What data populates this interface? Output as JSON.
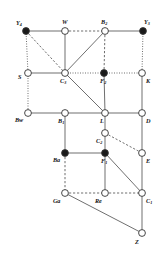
{
  "figure": {
    "type": "lattice-diagram",
    "width": 160,
    "height": 259,
    "background": "#ffffff",
    "edge_color": "#555555",
    "node_stroke": "#333333",
    "node_fill_open": "#ffffff",
    "node_fill_closed": "#1a1a1a"
  },
  "nodes": [
    {
      "id": "Y4",
      "label": "Y",
      "sub": "4",
      "x": 26,
      "y": 31,
      "filled": true,
      "label_dx": -10,
      "label_dy": -11
    },
    {
      "id": "W",
      "label": "W",
      "sub": "",
      "x": 65,
      "y": 31,
      "filled": false,
      "label_dx": -3,
      "label_dy": -12
    },
    {
      "id": "B2",
      "label": "B",
      "sub": "2",
      "x": 105,
      "y": 31,
      "filled": false,
      "label_dx": -4,
      "label_dy": -12
    },
    {
      "id": "Y3",
      "label": "Y",
      "sub": "3",
      "x": 143,
      "y": 31,
      "filled": true,
      "label_dx": 1,
      "label_dy": -12
    },
    {
      "id": "S",
      "label": "S",
      "sub": "",
      "x": 28,
      "y": 73,
      "filled": false,
      "label_dx": -10,
      "label_dy": 1
    },
    {
      "id": "C3",
      "label": "C",
      "sub": "3",
      "x": 65,
      "y": 73,
      "filled": false,
      "label_dx": -5,
      "label_dy": 5
    },
    {
      "id": "F2",
      "label": "F",
      "sub": "2",
      "x": 104,
      "y": 73,
      "filled": true,
      "label_dx": -4,
      "label_dy": 5
    },
    {
      "id": "K",
      "label": "K",
      "sub": "",
      "x": 142,
      "y": 73,
      "filled": false,
      "label_dx": 4,
      "label_dy": 5
    },
    {
      "id": "Bw",
      "label": "Bw",
      "sub": "",
      "x": 28,
      "y": 113,
      "filled": false,
      "label_dx": -13,
      "label_dy": 4
    },
    {
      "id": "B1",
      "label": "B",
      "sub": "1",
      "x": 65,
      "y": 113,
      "filled": false,
      "label_dx": -7,
      "label_dy": 5
    },
    {
      "id": "L",
      "label": "L",
      "sub": "",
      "x": 105,
      "y": 113,
      "filled": false,
      "label_dx": -5,
      "label_dy": 5
    },
    {
      "id": "D",
      "label": "D",
      "sub": "",
      "x": 142,
      "y": 113,
      "filled": false,
      "label_dx": 4,
      "label_dy": 5
    },
    {
      "id": "C2",
      "label": "C",
      "sub": "2",
      "x": 105,
      "y": 133,
      "filled": false,
      "label_dx": -9,
      "label_dy": 5
    },
    {
      "id": "Ba",
      "label": "Ba",
      "sub": "",
      "x": 65,
      "y": 153,
      "filled": true,
      "label_dx": -12,
      "label_dy": 4
    },
    {
      "id": "F1",
      "label": "F",
      "sub": "1",
      "x": 105,
      "y": 153,
      "filled": true,
      "label_dx": -4,
      "label_dy": 5
    },
    {
      "id": "E",
      "label": "E",
      "sub": "",
      "x": 142,
      "y": 153,
      "filled": false,
      "label_dx": 4,
      "label_dy": 5
    },
    {
      "id": "Ga",
      "label": "Ga",
      "sub": "",
      "x": 65,
      "y": 193,
      "filled": false,
      "label_dx": -12,
      "label_dy": 5
    },
    {
      "id": "Re",
      "label": "Re",
      "sub": "",
      "x": 105,
      "y": 193,
      "filled": false,
      "label_dx": -10,
      "label_dy": 5
    },
    {
      "id": "C1",
      "label": "C",
      "sub": "1",
      "x": 142,
      "y": 193,
      "filled": false,
      "label_dx": 4,
      "label_dy": 5
    },
    {
      "id": "Z",
      "label": "Z",
      "sub": "",
      "x": 142,
      "y": 233,
      "filled": false,
      "label_dx": -7,
      "label_dy": 6
    }
  ],
  "edges": [
    {
      "from": "Y4",
      "to": "W",
      "style": "solid"
    },
    {
      "from": "W",
      "to": "B2",
      "style": "dashed"
    },
    {
      "from": "B2",
      "to": "Y3",
      "style": "solid"
    },
    {
      "from": "Y4",
      "to": "S",
      "style": "dotted"
    },
    {
      "from": "Y4",
      "to": "C3",
      "style": "dashed"
    },
    {
      "from": "W",
      "to": "C3",
      "style": "solid"
    },
    {
      "from": "B2",
      "to": "C3",
      "style": "solid"
    },
    {
      "from": "B2",
      "to": "F2",
      "style": "dashed"
    },
    {
      "from": "Y3",
      "to": "K",
      "style": "dotted"
    },
    {
      "from": "S",
      "to": "C3",
      "style": "solid"
    },
    {
      "from": "C3",
      "to": "F2",
      "style": "dotted"
    },
    {
      "from": "F2",
      "to": "K",
      "style": "dotted"
    },
    {
      "from": "S",
      "to": "Bw",
      "style": "dotted"
    },
    {
      "from": "C3",
      "to": "L",
      "style": "solid"
    },
    {
      "from": "F2",
      "to": "L",
      "style": "solid"
    },
    {
      "from": "K",
      "to": "D",
      "style": "solid"
    },
    {
      "from": "Bw",
      "to": "B1",
      "style": "solid"
    },
    {
      "from": "B1",
      "to": "L",
      "style": "solid"
    },
    {
      "from": "L",
      "to": "D",
      "style": "solid"
    },
    {
      "from": "L",
      "to": "C2",
      "style": "solid"
    },
    {
      "from": "B1",
      "to": "Ba",
      "style": "solid"
    },
    {
      "from": "C2",
      "to": "F1",
      "style": "solid"
    },
    {
      "from": "C2",
      "to": "E",
      "style": "dashed"
    },
    {
      "from": "D",
      "to": "E",
      "style": "solid"
    },
    {
      "from": "Ba",
      "to": "F1",
      "style": "solid"
    },
    {
      "from": "Ba",
      "to": "Ga",
      "style": "dashed"
    },
    {
      "from": "F1",
      "to": "Re",
      "style": "solid"
    },
    {
      "from": "F1",
      "to": "C1",
      "style": "solid"
    },
    {
      "from": "E",
      "to": "C1",
      "style": "solid"
    },
    {
      "from": "Ga",
      "to": "Re",
      "style": "dashed"
    },
    {
      "from": "Re",
      "to": "C1",
      "style": "dashed"
    },
    {
      "from": "Ga",
      "to": "Z",
      "style": "solid"
    },
    {
      "from": "C1",
      "to": "Z",
      "style": "solid"
    }
  ]
}
